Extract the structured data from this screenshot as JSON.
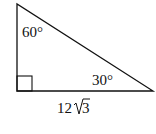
{
  "diagram": {
    "type": "right-triangle",
    "angles": {
      "top": "60°",
      "bottom_right": "30°",
      "bottom_left": "right-angle"
    },
    "side_labels": {
      "bottom": {
        "coefficient": "12",
        "radicand": "3"
      }
    },
    "colors": {
      "stroke": "#111111",
      "background": "#ffffff"
    }
  }
}
